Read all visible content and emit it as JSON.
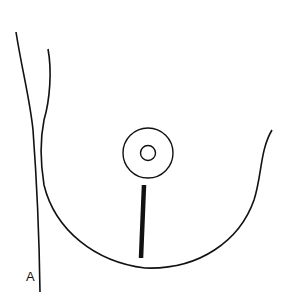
{
  "figure": {
    "panel_label": "A",
    "colors": {
      "stroke": "#111111",
      "background": "#ffffff"
    }
  }
}
